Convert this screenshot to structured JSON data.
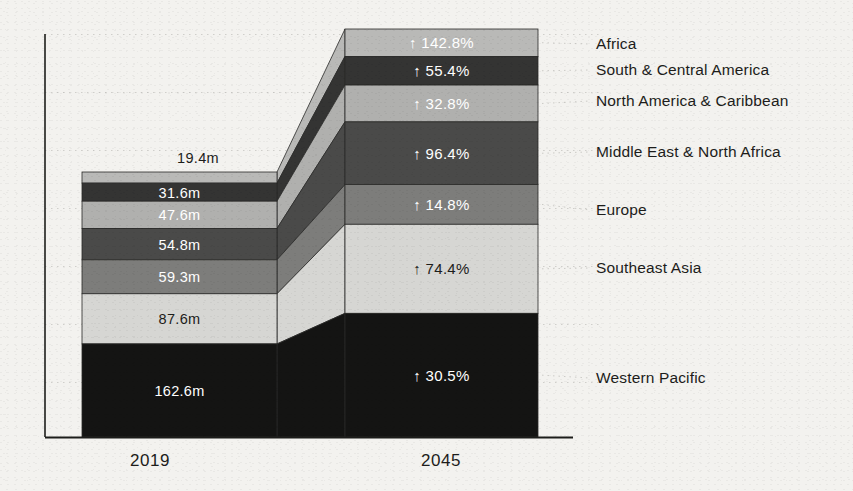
{
  "chart_data": {
    "type": "bar",
    "subtype": "stacked-bar-with-flow-ribbons",
    "title": "",
    "xlabel": "",
    "ylabel": "",
    "categories": [
      "2019",
      "2045"
    ],
    "grid": "dotted-horizontal-faint",
    "legend_position": "right",
    "ylim": [
      0,
      700
    ],
    "units": "millions of people",
    "series": [
      {
        "name": "Africa",
        "value_2019": "19.4m",
        "value_2019_num": 19.4,
        "change_2045": "↑ 142.8%",
        "change_2045_num": 142.8,
        "value_2045_num": 47.1,
        "color": "#b9b9b7",
        "label_color_2019": "#1d1d1b",
        "label_color_2045": "#ffffff",
        "label_2019_outside": true
      },
      {
        "name": "South & Central America",
        "value_2019": "31.6m",
        "value_2019_num": 31.6,
        "change_2045": "↑ 55.4%",
        "change_2045_num": 55.4,
        "value_2045_num": 49.1,
        "color": "#343433",
        "label_color_2019": "#ffffff",
        "label_color_2045": "#ffffff",
        "label_2019_outside": false
      },
      {
        "name": "North America & Caribbean",
        "value_2019": "47.6m",
        "value_2019_num": 47.6,
        "change_2045": "↑ 32.8%",
        "change_2045_num": 32.8,
        "value_2045_num": 63.2,
        "color": "#b0b0ae",
        "label_color_2019": "#ffffff",
        "label_color_2045": "#ffffff",
        "label_2019_outside": false
      },
      {
        "name": "Middle East & North Africa",
        "value_2019": "54.8m",
        "value_2019_num": 54.8,
        "change_2045": "↑ 96.4%",
        "change_2045_num": 96.4,
        "value_2045_num": 107.6,
        "color": "#4a4a49",
        "label_color_2019": "#ffffff",
        "label_color_2045": "#ffffff",
        "label_2019_outside": false
      },
      {
        "name": "Europe",
        "value_2019": "59.3m",
        "value_2019_num": 59.3,
        "change_2045": "↑ 14.8%",
        "change_2045_num": 14.8,
        "value_2045_num": 68.1,
        "color": "#7d7d7b",
        "label_color_2019": "#ffffff",
        "label_color_2045": "#ffffff",
        "label_2019_outside": false
      },
      {
        "name": "Southeast Asia",
        "value_2019": "87.6m",
        "value_2019_num": 87.6,
        "change_2045": "↑ 74.4%",
        "change_2045_num": 74.4,
        "value_2045_num": 152.8,
        "color": "#d6d6d3",
        "label_color_2019": "#1d1d1b",
        "label_color_2045": "#1d1d1b",
        "label_2019_outside": false
      },
      {
        "name": "Western Pacific",
        "value_2019": "162.6m",
        "value_2019_num": 162.6,
        "change_2045": "↑ 30.5%",
        "change_2045_num": 30.5,
        "value_2045_num": 212.2,
        "color": "#141413",
        "label_color_2019": "#ffffff",
        "label_color_2045": "#ffffff",
        "label_2019_outside": false
      }
    ],
    "totals": {
      "2019": 462.9,
      "2045": 700.1
    }
  },
  "axis": {
    "ticks": [
      "2019",
      "2045"
    ],
    "tick_2019": "2019",
    "tick_2045": "2045"
  },
  "legend": {
    "items": [
      "Africa",
      "South & Central America",
      "North America & Caribbean",
      "Middle East & North Africa",
      "Europe",
      "Southeast Asia",
      "Western Pacific"
    ]
  },
  "colors": {
    "background": "#f3f2ef",
    "axis": "#1d1d1b",
    "gridline": "#c9c8c4",
    "text": "#1d1d1b",
    "text_light": "#ffffff"
  }
}
